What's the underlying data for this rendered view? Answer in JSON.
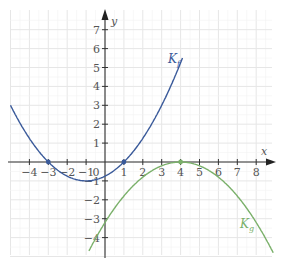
{
  "chart_data": {
    "type": "line",
    "title": "",
    "xlabel": "x",
    "ylabel": "y",
    "xlim": [
      -5,
      8.7
    ],
    "ylim": [
      -5,
      7.8
    ],
    "grid": true,
    "x_ticks": [
      -4,
      -3,
      -2,
      -1,
      1,
      2,
      3,
      4,
      5,
      6,
      7,
      8
    ],
    "y_ticks": [
      -4,
      -3,
      -2,
      -1,
      1,
      2,
      3,
      4,
      5,
      6,
      7
    ],
    "origin_label": "0",
    "series": [
      {
        "name": "K_f",
        "label": "K",
        "subscript": "f",
        "color": "#3a5a9a",
        "formula": "0.25*(x+3)*(x-1)",
        "x": [
          -5,
          -4,
          -3,
          -2,
          -1,
          0,
          1,
          2,
          3,
          4
        ],
        "y": [
          3,
          1.25,
          0,
          -0.75,
          -1,
          -0.75,
          0,
          1.25,
          3,
          5.25
        ],
        "marked_points": [
          [
            -3,
            0
          ],
          [
            1,
            0
          ]
        ]
      },
      {
        "name": "K_g",
        "label": "K",
        "subscript": "g",
        "color": "#7ab06a",
        "formula": "-0.2*(x-4)^2",
        "x": [
          -0.8,
          0,
          1,
          2,
          3,
          4,
          5,
          6,
          7,
          8,
          8.8
        ],
        "y": [
          -4.6,
          -3.2,
          -1.8,
          -0.8,
          -0.2,
          0,
          -0.2,
          -0.8,
          -1.8,
          -3.2,
          -4.6
        ],
        "marked_points": [
          [
            4,
            0
          ]
        ]
      }
    ]
  }
}
